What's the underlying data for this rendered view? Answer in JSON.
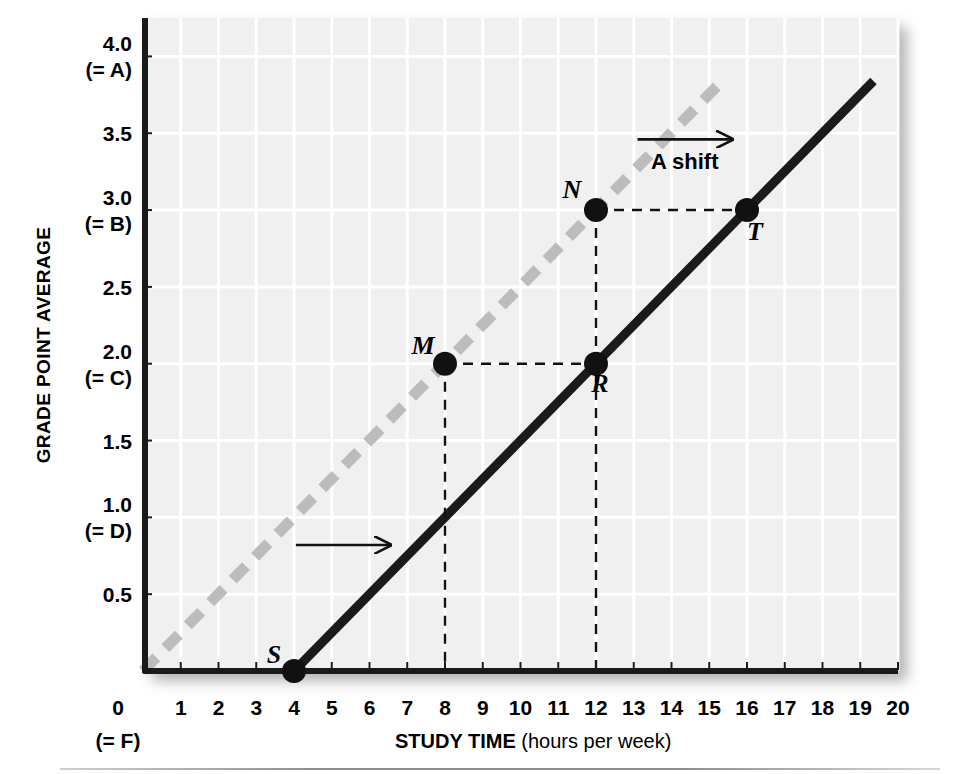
{
  "chart_data": {
    "type": "line",
    "title": "",
    "xlabel_bold": "STUDY TIME",
    "xlabel_rest": " (hours per week)",
    "ylabel": "GRADE POINT AVERAGE",
    "xlim": [
      0,
      20
    ],
    "ylim": [
      0,
      4.25
    ],
    "grid": true,
    "x_ticks": [
      "0",
      "1",
      "2",
      "3",
      "4",
      "5",
      "6",
      "7",
      "8",
      "9",
      "10",
      "11",
      "12",
      "13",
      "14",
      "15",
      "16",
      "17",
      "18",
      "19",
      "20"
    ],
    "x_origin_sublabel": "(= F)",
    "y_ticks": [
      {
        "value": 0.5,
        "label": "0.5",
        "sublabel": ""
      },
      {
        "value": 1.0,
        "label": "1.0",
        "sublabel": "(= D)"
      },
      {
        "value": 1.5,
        "label": "1.5",
        "sublabel": ""
      },
      {
        "value": 2.0,
        "label": "2.0",
        "sublabel": "(= C)"
      },
      {
        "value": 2.5,
        "label": "2.5",
        "sublabel": ""
      },
      {
        "value": 3.0,
        "label": "3.0",
        "sublabel": "(= B)"
      },
      {
        "value": 3.5,
        "label": "3.5",
        "sublabel": ""
      },
      {
        "value": 4.0,
        "label": "4.0",
        "sublabel": "(= A)"
      }
    ],
    "series": [
      {
        "name": "original-line",
        "style": "dashed",
        "color": "#bcbcbc",
        "points": [
          [
            0,
            0
          ],
          [
            15.3,
            3.83
          ]
        ],
        "slope": 0.25,
        "intercept": 0
      },
      {
        "name": "shifted-line",
        "style": "solid",
        "color": "#1a1a1a",
        "points": [
          [
            4,
            0
          ],
          [
            19.35,
            3.84
          ]
        ],
        "slope": 0.25,
        "intercept": -1
      }
    ],
    "annotations": [
      {
        "name": "point-S",
        "label": "S",
        "x": 4,
        "y": 0,
        "label_dx": -20,
        "label_dy": -8
      },
      {
        "name": "point-M",
        "label": "M",
        "x": 8,
        "y": 2.0,
        "label_dx": -22,
        "label_dy": -10
      },
      {
        "name": "point-R",
        "label": "R",
        "x": 12,
        "y": 2.0,
        "label_dx": 4,
        "label_dy": 28
      },
      {
        "name": "point-N",
        "label": "N",
        "x": 12,
        "y": 3.0,
        "label_dx": -24,
        "label_dy": -12
      },
      {
        "name": "point-T",
        "label": "T",
        "x": 16,
        "y": 3.0,
        "label_dx": 8,
        "label_dy": 30
      }
    ],
    "shift_label": "A shift",
    "arrows": [
      {
        "name": "shift-arrow-upper",
        "x1": 13.1,
        "y1": 3.46,
        "x2": 15.6,
        "y2": 3.46
      },
      {
        "name": "shift-arrow-lower",
        "x1": 4.05,
        "y1": 0.82,
        "x2": 6.55,
        "y2": 0.82
      }
    ],
    "guide_lines": [
      {
        "name": "guide-M-to-R",
        "x1": 8,
        "y1": 2.0,
        "x2": 12,
        "y2": 2.0
      },
      {
        "name": "guide-N-to-T",
        "x1": 12,
        "y1": 3.0,
        "x2": 16,
        "y2": 3.0
      },
      {
        "name": "guide-M-drop",
        "x1": 8,
        "y1": 2.0,
        "x2": 8,
        "y2": 0
      },
      {
        "name": "guide-N-drop",
        "x1": 12,
        "y1": 3.0,
        "x2": 12,
        "y2": 0
      }
    ],
    "colors": {
      "plot_background": "#f0f0f0",
      "gridline": "#ffffff",
      "axis": "#1a1a1a",
      "dashed_line": "#bcbcbc",
      "solid_line": "#1a1a1a",
      "text": "#000000"
    }
  }
}
